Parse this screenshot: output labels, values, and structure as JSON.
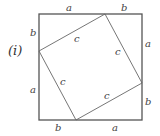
{
  "figure_label": "(i)",
  "outer_square": {
    "side_segments": [
      "a",
      "b"
    ]
  },
  "inner_square": {
    "side_label": "c"
  },
  "labels": {
    "top_a": "a",
    "top_b": "b",
    "right_a": "a",
    "right_b": "b",
    "bottom_b": "b",
    "bottom_a": "a",
    "left_b": "b",
    "left_a": "a",
    "inner_top": "c",
    "inner_right": "c",
    "inner_bottom": "c",
    "inner_left": "c"
  },
  "colors": {
    "outer_stroke": "#555555",
    "inner_stroke": "#666666"
  }
}
